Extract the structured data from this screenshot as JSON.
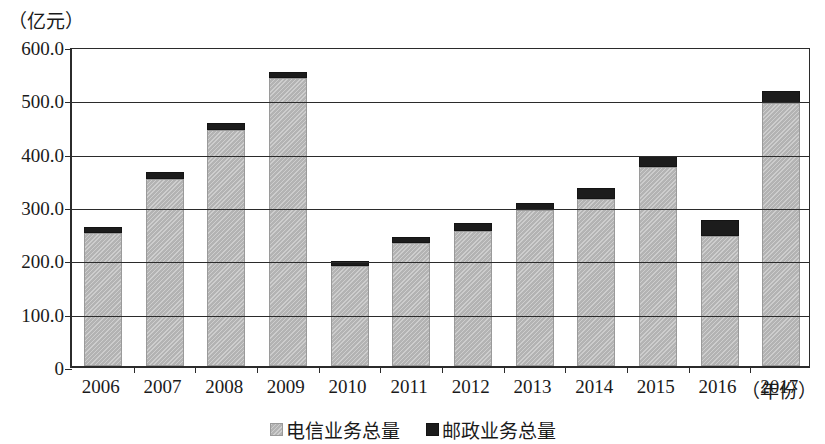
{
  "chart_data": {
    "type": "bar",
    "stacked": true,
    "title": "",
    "unit_label": "（亿元）",
    "xlabel": "（年份）",
    "ylabel": "",
    "grid": true,
    "legend_position": "bottom-center",
    "ylim": [
      0,
      600
    ],
    "yticks": [
      "0",
      "100.0",
      "200.0",
      "300.0",
      "400.0",
      "500.0",
      "600.0"
    ],
    "ytick_values": [
      0,
      100,
      200,
      300,
      400,
      500,
      600
    ],
    "categories": [
      "2006",
      "2007",
      "2008",
      "2009",
      "2010",
      "2011",
      "2012",
      "2013",
      "2014",
      "2015",
      "2016",
      "2017"
    ],
    "series": [
      {
        "name": "电信业务总量",
        "color": "#b3b3b3",
        "values": [
          249.0,
          351.0,
          443.0,
          540.0,
          187.0,
          231.0,
          253.0,
          293.0,
          313.0,
          373.0,
          244.0,
          493.0
        ]
      },
      {
        "name": "邮政业务总量",
        "color": "#1c1c1c",
        "values": [
          11.0,
          13.0,
          13.0,
          11.0,
          10.0,
          11.0,
          15.0,
          13.0,
          21.0,
          21.0,
          30.0,
          23.0
        ]
      }
    ],
    "totals": [
      260.0,
      364.0,
      456.0,
      551.0,
      197.0,
      242.0,
      268.0,
      306.0,
      334.0,
      394.0,
      274.0,
      516.0
    ]
  },
  "legend": {
    "items": [
      {
        "label": "电信业务总量",
        "swatch": "gray-swatch"
      },
      {
        "label": "邮政业务总量",
        "swatch": "black-swatch"
      }
    ]
  }
}
